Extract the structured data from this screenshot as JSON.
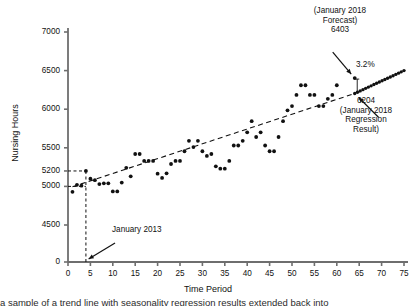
{
  "chart_data": {
    "type": "scatter",
    "title": "",
    "xlabel": "Time Period",
    "ylabel": "Nursing Hours",
    "xlim": [
      0,
      75
    ],
    "ylim": [
      4400,
      7000
    ],
    "grid": false,
    "legend": "none",
    "xticks": [
      0,
      5,
      10,
      15,
      20,
      25,
      30,
      35,
      40,
      45,
      50,
      55,
      60,
      65,
      70,
      75
    ],
    "yticks": [
      0,
      4500,
      5000,
      5200,
      5500,
      6000,
      6500,
      7000
    ],
    "y_axis_break": true,
    "y_axis_break_note": "axis is broken between 0 and 4500",
    "series": [
      {
        "name": "Nursing Hours observations",
        "marker": "filled-circle",
        "color": "#111111",
        "points": [
          [
            1,
            4930
          ],
          [
            2,
            5020
          ],
          [
            3,
            5010
          ],
          [
            4,
            5200
          ],
          [
            5,
            5100
          ],
          [
            6,
            5080
          ],
          [
            7,
            5030
          ],
          [
            8,
            5040
          ],
          [
            9,
            5040
          ],
          [
            10,
            4935
          ],
          [
            11,
            4935
          ],
          [
            12,
            5050
          ],
          [
            13,
            5240
          ],
          [
            14,
            5130
          ],
          [
            15,
            5420
          ],
          [
            16,
            5420
          ],
          [
            17,
            5330
          ],
          [
            18,
            5330
          ],
          [
            19,
            5330
          ],
          [
            20,
            5165
          ],
          [
            21,
            5110
          ],
          [
            22,
            5170
          ],
          [
            23,
            5290
          ],
          [
            24,
            5330
          ],
          [
            25,
            5330
          ],
          [
            26,
            5455
          ],
          [
            27,
            5590
          ],
          [
            28,
            5510
          ],
          [
            29,
            5590
          ],
          [
            30,
            5455
          ],
          [
            31,
            5395
          ],
          [
            32,
            5420
          ],
          [
            33,
            5260
          ],
          [
            34,
            5230
          ],
          [
            35,
            5230
          ],
          [
            36,
            5330
          ],
          [
            37,
            5530
          ],
          [
            38,
            5530
          ],
          [
            39,
            5590
          ],
          [
            40,
            5700
          ],
          [
            41,
            5845
          ],
          [
            42,
            5640
          ],
          [
            43,
            5700
          ],
          [
            44,
            5530
          ],
          [
            45,
            5455
          ],
          [
            46,
            5455
          ],
          [
            47,
            5640
          ],
          [
            48,
            5845
          ],
          [
            49,
            5985
          ],
          [
            50,
            6040
          ],
          [
            51,
            6185
          ],
          [
            52,
            6310
          ],
          [
            53,
            6310
          ],
          [
            54,
            6185
          ],
          [
            55,
            6185
          ],
          [
            56,
            6040
          ],
          [
            57,
            6040
          ],
          [
            58,
            6135
          ],
          [
            59,
            6185
          ],
          [
            60,
            6310
          ],
          [
            64,
            6403
          ]
        ]
      },
      {
        "name": "Regression trend line",
        "type": "line",
        "style": "dashed",
        "color": "#111111",
        "points": [
          [
            1,
            4995
          ],
          [
            64,
            6204
          ]
        ]
      },
      {
        "name": "Forecast extension",
        "type": "line",
        "style": "dotted",
        "color": "#111111",
        "points": [
          [
            64,
            6204
          ],
          [
            75,
            6500
          ]
        ]
      },
      {
        "name": "January 2013 reference line",
        "type": "line",
        "style": "dashed",
        "color": "#111111",
        "points": [
          [
            4,
            0
          ],
          [
            4,
            5200
          ]
        ]
      },
      {
        "name": "5200 reference line",
        "type": "line",
        "style": "dashed",
        "color": "#111111",
        "points": [
          [
            0,
            5200
          ],
          [
            4,
            5200
          ]
        ]
      },
      {
        "name": "5000 reference line",
        "type": "line",
        "style": "dashed",
        "color": "#111111",
        "points": [
          [
            0,
            5000
          ],
          [
            4,
            5000
          ]
        ]
      }
    ],
    "annotations": [
      {
        "name": "january-2018-forecast",
        "text": "(January 2018\nForecast)\n6403",
        "value": 6403,
        "points_to": [
          64,
          6403
        ]
      },
      {
        "name": "january-2018-regression-result",
        "text": "6204\n(January 2018\nRegression\nResult)",
        "value": 6204,
        "points_to": [
          64,
          6204
        ]
      },
      {
        "name": "percent-difference",
        "text": "3.2%",
        "value": 3.2
      },
      {
        "name": "january-2013",
        "text": "January 2013",
        "points_to": [
          4,
          0
        ]
      }
    ]
  },
  "axes": {
    "x_title": "Time Period",
    "y_title": "Nursing Hours",
    "x_ticklabels": [
      "0",
      "5",
      "10",
      "15",
      "20",
      "25",
      "30",
      "35",
      "40",
      "45",
      "50",
      "55",
      "60",
      "65",
      "70",
      "75"
    ],
    "y_ticklabels": [
      "0",
      "4500",
      "5000",
      "5200",
      "5500",
      "6000",
      "6500",
      "7000"
    ]
  },
  "annotations": {
    "forecast": "(January 2018\nForecast)\n6403",
    "regression": "6204\n(January 2018\nRegression\nResult)",
    "percent": "3.2%",
    "jan2013": "January 2013"
  },
  "caption": {
    "text": "a sample of a trend line with seasonality regression results extended back into"
  },
  "colors": {
    "marker": "#111111",
    "axis": "#6e6e6e",
    "text": "#111111"
  }
}
